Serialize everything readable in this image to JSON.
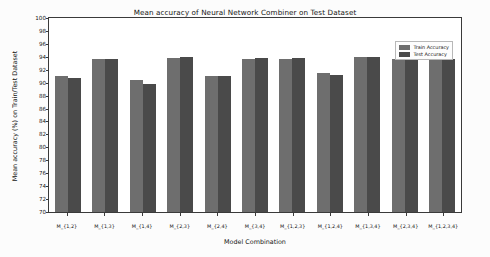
{
  "chart_data": {
    "type": "bar",
    "title": "Mean accuracy of Neural Network Combiner on Test Dataset",
    "xlabel": "Model Combination",
    "ylabel": "Mean accuracy (%) on Train/Test Dataset",
    "ylim": [
      70,
      100
    ],
    "ytick_step": 2,
    "yticks": [
      70,
      72,
      74,
      76,
      78,
      80,
      82,
      84,
      86,
      88,
      90,
      92,
      94,
      96,
      98,
      100
    ],
    "grid": false,
    "legend_position": "upper right",
    "categories": [
      "M_{1,2}",
      "M_{1,3}",
      "M_{1,4}",
      "M_{2,3}",
      "M_{2,4}",
      "M_{3,4}",
      "M_{1,2,3}",
      "M_{1,2,4}",
      "M_{1,3,4}",
      "M_{2,3,4}",
      "M_{1,2,3,4}"
    ],
    "series": [
      {
        "name": "Train Accuracy",
        "color": "#6e6e6e",
        "values": [
          91.0,
          93.7,
          90.4,
          93.8,
          91.1,
          93.7,
          93.6,
          91.5,
          93.9,
          93.7,
          93.8
        ]
      },
      {
        "name": "Test Accuracy",
        "color": "#4a4a4a",
        "values": [
          90.8,
          93.6,
          89.8,
          93.9,
          91.1,
          93.8,
          93.8,
          91.2,
          93.9,
          93.5,
          93.7
        ]
      }
    ]
  },
  "figure": {
    "background": "#fcfcfc",
    "plot_background": "#ffffff",
    "axis_color": "#3a3a3a"
  }
}
